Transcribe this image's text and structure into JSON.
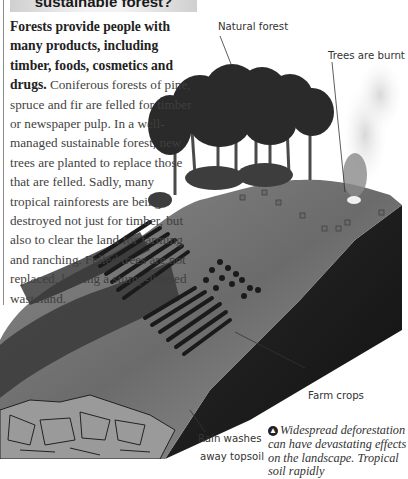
{
  "header": {
    "title": "sustainable forest?"
  },
  "body": {
    "lead_bold": "Forests provide people with many products, including  timber, foods, cosmetics and drugs.",
    "text": " Coniferous forests of pine, spruce and fir are felled for timber or newspaper pulp. In a well-managed sustainable forest, new trees are planted to replace those that are felled. Sadly, many tropical rainforests are being destroyed not just for timber, but also to clear the land for farming and ranching. Felled trees are not replaced, leaving a stump-littered wasteland."
  },
  "illustration": {
    "labels": {
      "natural_forest": "Natural forest",
      "trees_burnt": "Trees are burnt",
      "farm_crops": "Farm crops",
      "rain_washes": "Rain washes",
      "rain_washes_2": "away topsoil"
    }
  },
  "caption": {
    "icon": "up-arrow-icon",
    "text": "Widespread deforestation can have devastating effects on the landscape. Tropical soil rapidly"
  }
}
